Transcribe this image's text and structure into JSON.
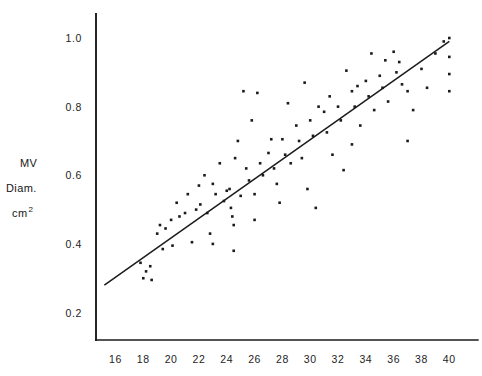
{
  "figure": {
    "background": "#ffffff",
    "ink_color": "#1b1b1b"
  },
  "axis_label": {
    "line1": "MV",
    "line2": "Diam.",
    "line3_base": "cm",
    "line3_sup": "2"
  },
  "chart_data": {
    "type": "scatter",
    "title": "",
    "xlabel": "",
    "ylabel": "MV Diam. cm2",
    "xlim": [
      14.6,
      41.2
    ],
    "ylim": [
      0.12,
      1.07
    ],
    "grid": false,
    "legend": "none",
    "xticks": [
      16,
      18,
      20,
      22,
      24,
      26,
      28,
      30,
      32,
      34,
      36,
      38,
      40
    ],
    "xtick_labels": [
      "16",
      "18",
      "20",
      "22",
      "24",
      "26",
      "28",
      "30",
      "32",
      "34",
      "36",
      "38",
      "40"
    ],
    "yticks": [
      0.2,
      0.4,
      0.6,
      0.8,
      1.0
    ],
    "ytick_labels": [
      "0.2",
      "0.4",
      "0.6",
      "0.8",
      "1.0"
    ],
    "points": [
      [
        17.8,
        0.345
      ],
      [
        18.0,
        0.3
      ],
      [
        18.2,
        0.32
      ],
      [
        18.5,
        0.335
      ],
      [
        18.6,
        0.295
      ],
      [
        19.0,
        0.43
      ],
      [
        19.2,
        0.455
      ],
      [
        19.6,
        0.445
      ],
      [
        20.0,
        0.47
      ],
      [
        20.1,
        0.395
      ],
      [
        20.4,
        0.52
      ],
      [
        20.6,
        0.48
      ],
      [
        21.0,
        0.49
      ],
      [
        21.2,
        0.545
      ],
      [
        21.5,
        0.405
      ],
      [
        21.8,
        0.5
      ],
      [
        22.0,
        0.57
      ],
      [
        22.1,
        0.515
      ],
      [
        22.4,
        0.6
      ],
      [
        22.6,
        0.49
      ],
      [
        23.0,
        0.575
      ],
      [
        23.2,
        0.545
      ],
      [
        23.5,
        0.635
      ],
      [
        23.8,
        0.525
      ],
      [
        24.0,
        0.555
      ],
      [
        24.2,
        0.56
      ],
      [
        24.3,
        0.505
      ],
      [
        24.4,
        0.48
      ],
      [
        24.5,
        0.455
      ],
      [
        24.5,
        0.38
      ],
      [
        24.6,
        0.65
      ],
      [
        24.8,
        0.7
      ],
      [
        25.0,
        0.54
      ],
      [
        25.2,
        0.845
      ],
      [
        25.4,
        0.62
      ],
      [
        25.6,
        0.585
      ],
      [
        25.8,
        0.76
      ],
      [
        26.0,
        0.545
      ],
      [
        26.2,
        0.84
      ],
      [
        26.4,
        0.635
      ],
      [
        26.6,
        0.6
      ],
      [
        27.0,
        0.665
      ],
      [
        27.2,
        0.705
      ],
      [
        27.4,
        0.62
      ],
      [
        27.6,
        0.575
      ],
      [
        28.0,
        0.705
      ],
      [
        28.2,
        0.66
      ],
      [
        28.4,
        0.81
      ],
      [
        28.6,
        0.635
      ],
      [
        29.0,
        0.745
      ],
      [
        29.2,
        0.7
      ],
      [
        29.4,
        0.65
      ],
      [
        29.6,
        0.87
      ],
      [
        30.0,
        0.76
      ],
      [
        30.2,
        0.715
      ],
      [
        30.4,
        0.505
      ],
      [
        30.6,
        0.8
      ],
      [
        31.0,
        0.785
      ],
      [
        31.2,
        0.725
      ],
      [
        31.4,
        0.83
      ],
      [
        31.6,
        0.66
      ],
      [
        32.0,
        0.8
      ],
      [
        32.2,
        0.76
      ],
      [
        32.4,
        0.615
      ],
      [
        32.6,
        0.905
      ],
      [
        33.0,
        0.845
      ],
      [
        33.2,
        0.8
      ],
      [
        33.4,
        0.86
      ],
      [
        33.6,
        0.745
      ],
      [
        34.0,
        0.875
      ],
      [
        34.2,
        0.83
      ],
      [
        34.4,
        0.955
      ],
      [
        34.6,
        0.79
      ],
      [
        35.0,
        0.89
      ],
      [
        35.2,
        0.855
      ],
      [
        35.4,
        0.935
      ],
      [
        35.6,
        0.815
      ],
      [
        36.0,
        0.96
      ],
      [
        36.2,
        0.9
      ],
      [
        36.4,
        0.93
      ],
      [
        36.6,
        0.865
      ],
      [
        37.0,
        0.845
      ],
      [
        37.4,
        0.79
      ],
      [
        38.0,
        0.91
      ],
      [
        38.4,
        0.855
      ],
      [
        39.0,
        0.955
      ],
      [
        39.6,
        0.99
      ],
      [
        40.0,
        1.0
      ],
      [
        40.0,
        0.945
      ],
      [
        40.0,
        0.895
      ],
      [
        40.0,
        0.845
      ],
      [
        23.0,
        0.4
      ],
      [
        19.4,
        0.385
      ],
      [
        22.8,
        0.43
      ],
      [
        26.0,
        0.47
      ],
      [
        27.8,
        0.52
      ],
      [
        29.8,
        0.56
      ],
      [
        33.0,
        0.69
      ],
      [
        37.0,
        0.7
      ]
    ],
    "fit_line": {
      "label": "regression line",
      "x_start": 15.2,
      "y_start": 0.28,
      "x_end": 40.0,
      "y_end": 0.99
    }
  }
}
